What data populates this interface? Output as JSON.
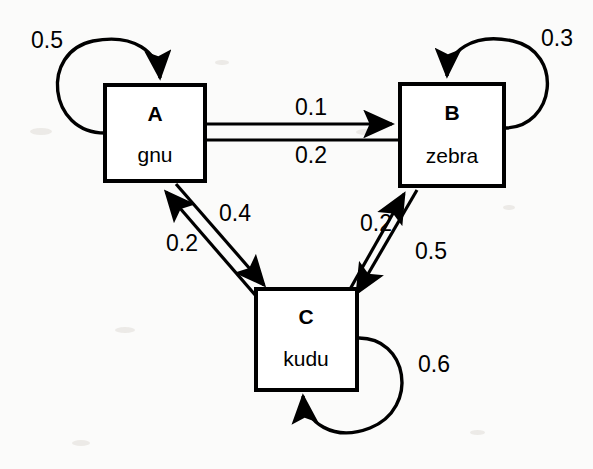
{
  "diagram": {
    "type": "markov-chain-state-diagram",
    "nodes": [
      {
        "id": "A",
        "label": "A",
        "name": "gnu",
        "x": 105,
        "y": 85,
        "w": 100,
        "h": 96
      },
      {
        "id": "B",
        "label": "B",
        "name": "zebra",
        "x": 400,
        "y": 84,
        "w": 104,
        "h": 102
      },
      {
        "id": "C",
        "label": "C",
        "name": "kudu",
        "x": 256,
        "y": 289,
        "w": 101,
        "h": 101
      }
    ],
    "edges": [
      {
        "from": "A",
        "to": "A",
        "weight": "0.5",
        "kind": "self-loop",
        "label_x": 47,
        "label_y": 42
      },
      {
        "from": "B",
        "to": "B",
        "weight": "0.3",
        "kind": "self-loop",
        "label_x": 557,
        "label_y": 40
      },
      {
        "from": "C",
        "to": "C",
        "weight": "0.6",
        "kind": "self-loop",
        "label_x": 434,
        "label_y": 366
      },
      {
        "from": "A",
        "to": "B",
        "weight": "0.1",
        "kind": "directed",
        "label_x": 311,
        "label_y": 109
      },
      {
        "from": "B",
        "to": "A",
        "weight": "0.2",
        "kind": "directed",
        "label_x": 311,
        "label_y": 157
      },
      {
        "from": "A",
        "to": "C",
        "weight": "0.4",
        "kind": "directed",
        "label_x": 235,
        "label_y": 215
      },
      {
        "from": "C",
        "to": "A",
        "weight": "0.2",
        "kind": "directed",
        "label_x": 182,
        "label_y": 245
      },
      {
        "from": "B",
        "to": "C",
        "weight": "0.5",
        "kind": "directed",
        "label_x": 431,
        "label_y": 253
      },
      {
        "from": "C",
        "to": "B",
        "weight": "0.2",
        "kind": "directed",
        "label_x": 376,
        "label_y": 225
      }
    ],
    "colors": {
      "stroke": "#000000",
      "node_fill": "#ffffff",
      "background": "#fbfbfa"
    }
  }
}
